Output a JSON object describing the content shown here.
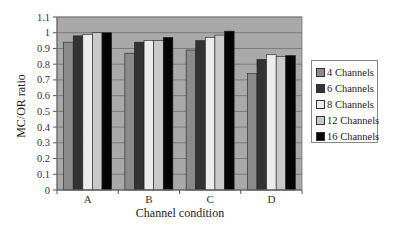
{
  "chart_data": {
    "type": "bar",
    "title": "",
    "xlabel": "Channel condition",
    "ylabel": "MC/OR ratio",
    "ylim": [
      0,
      1.1
    ],
    "yticks": [
      "0",
      "0.1",
      "0.2",
      "0.3",
      "0.4",
      "0.5",
      "0.6",
      "0.7",
      "0.8",
      "0.9",
      "1",
      "1.1"
    ],
    "grid": true,
    "legend_position": "right",
    "categories": [
      "A",
      "B",
      "C",
      "D"
    ],
    "series": [
      {
        "name": "4 Channels",
        "color": "#8a8a8a",
        "values": [
          0.94,
          0.87,
          0.89,
          0.74
        ]
      },
      {
        "name": "6 Channels",
        "color": "#333333",
        "values": [
          0.98,
          0.94,
          0.95,
          0.83
        ]
      },
      {
        "name": "8 Channels",
        "color": "#ececec",
        "values": [
          0.99,
          0.95,
          0.97,
          0.86
        ]
      },
      {
        "name": "12 Channels",
        "color": "#c9c9c9",
        "values": [
          1.0,
          0.95,
          0.985,
          0.85
        ]
      },
      {
        "name": "16 Channels",
        "color": "#050505",
        "values": [
          1.0,
          0.97,
          1.01,
          0.855
        ]
      }
    ]
  },
  "style": {
    "plot_background": "#a9a9a9",
    "gridline_color": "#6e6e6e",
    "axis_color": "#555555"
  }
}
